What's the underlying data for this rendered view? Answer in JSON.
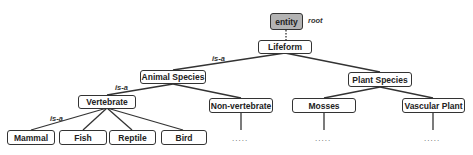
{
  "diagram": {
    "type": "taxonomy-tree",
    "root": {
      "label": "entity",
      "annotation": "root",
      "fill": "#b3b3b3"
    },
    "relation_label": "is-a",
    "nodes": {
      "entity": "entity",
      "lifeform": "Lifeform",
      "animal_species": "Animal Species",
      "plant_species": "Plant Species",
      "vertebrate": "Vertebrate",
      "non_vertebrate": "Non-vertebrate",
      "mosses": "Mosses",
      "vascular_plant": "Vascular Plant",
      "mammal": "Mammal",
      "fish": "Fish",
      "reptile": "Reptile",
      "bird": "Bird"
    },
    "edges": [
      [
        "entity",
        "lifeform"
      ],
      [
        "lifeform",
        "animal_species"
      ],
      [
        "lifeform",
        "plant_species"
      ],
      [
        "animal_species",
        "vertebrate"
      ],
      [
        "animal_species",
        "non_vertebrate"
      ],
      [
        "plant_species",
        "mosses"
      ],
      [
        "plant_species",
        "vascular_plant"
      ],
      [
        "vertebrate",
        "mammal"
      ],
      [
        "vertebrate",
        "fish"
      ],
      [
        "vertebrate",
        "reptile"
      ],
      [
        "vertebrate",
        "bird"
      ]
    ],
    "edge_labels": [
      "is-a",
      "is-a",
      "is-a"
    ],
    "ellipsis": "....."
  }
}
